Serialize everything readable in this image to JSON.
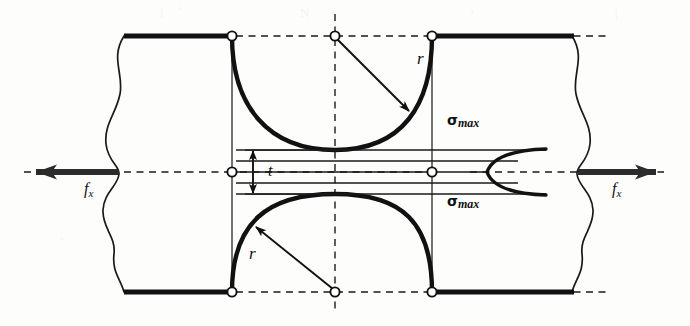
{
  "figure": {
    "background_color": "#fdfdfc",
    "line_color": "#111111",
    "node_fill_color": "#ffffff"
  },
  "labels": {
    "radius_top": "r",
    "radius_bottom": "r",
    "thickness": "t",
    "force_left": "f",
    "force_left_sub": "x",
    "force_right": "f",
    "force_right_sub": "x",
    "sigma_top": "σ",
    "sigma_top_sub": "max",
    "sigma_bottom": "σ",
    "sigma_bottom_sub": "max"
  },
  "geometry": {
    "plate_top_y": 36,
    "plate_bottom_y": 292,
    "centerline_y": 172,
    "notch_center_x": 335,
    "notch_left_x": 232,
    "notch_right_x": 432,
    "notch_radius": 100,
    "min_section_half_height": 22,
    "left_plate_edge_x": 118,
    "right_plate_edge_x": 578
  },
  "stress_profile": {
    "type": "line",
    "description": "Axial stress distribution across minimum section; maximum at notch roots, minimum at centerline",
    "axis": "y",
    "y_positions": [
      150,
      160,
      172,
      184,
      194
    ],
    "x_start": 432,
    "stress_values_normalized": [
      1.0,
      0.78,
      0.52,
      0.78,
      1.0
    ],
    "peak_label": "σmax",
    "peak_x": 546,
    "trough_x": 487
  },
  "nodes": [
    {
      "name": "top-left-notch-node",
      "x": 232,
      "y": 36
    },
    {
      "name": "top-center-node",
      "x": 335,
      "y": 36
    },
    {
      "name": "top-right-notch-node",
      "x": 432,
      "y": 36
    },
    {
      "name": "centerline-left-node",
      "x": 232,
      "y": 172
    },
    {
      "name": "centerline-right-node",
      "x": 432,
      "y": 172
    },
    {
      "name": "bottom-left-notch-node",
      "x": 232,
      "y": 292
    },
    {
      "name": "bottom-center-node",
      "x": 335,
      "y": 292
    },
    {
      "name": "bottom-right-notch-node",
      "x": 432,
      "y": 292
    }
  ]
}
